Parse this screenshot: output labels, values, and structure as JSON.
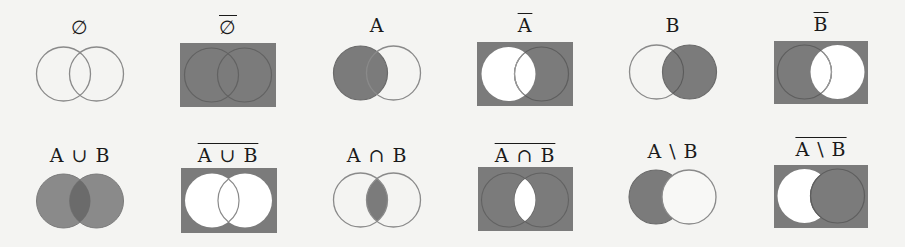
{
  "colors": {
    "background": "#f4f4f2",
    "fill": "#7b7b7b",
    "fill_light": "#8a8a8a",
    "fill_overlap": "#6b6b6b",
    "stroke": "#7a7a7a",
    "stroke_on_dark": "#5e5e5e",
    "white": "#ffffff",
    "label": "#1a1a1a"
  },
  "rows": [
    {
      "panels": [
        {
          "id": "empty",
          "label": "∅",
          "overline": false,
          "description": "Empty set: no region shaded"
        },
        {
          "id": "empty-complement",
          "label": "∅",
          "overline": true,
          "description": "Complement of empty set: entire universe shaded"
        },
        {
          "id": "a",
          "label": "A",
          "overline": false,
          "description": "Set A shaded"
        },
        {
          "id": "a-complement",
          "label": "A",
          "overline": true,
          "description": "Complement of A: everything outside A shaded"
        },
        {
          "id": "b",
          "label": "B",
          "overline": false,
          "description": "Set B shaded"
        },
        {
          "id": "b-complement",
          "label": "B",
          "overline": true,
          "description": "Complement of B: everything outside B shaded"
        }
      ]
    },
    {
      "panels": [
        {
          "id": "union",
          "label": "A ∪ B",
          "overline": false,
          "description": "Union: both circles shaded"
        },
        {
          "id": "union-complement",
          "label": "A ∪ B",
          "overline": true,
          "description": "Complement of union: outside both circles shaded"
        },
        {
          "id": "intersection",
          "label": "A ∩ B",
          "overline": false,
          "description": "Intersection: lens shaded"
        },
        {
          "id": "intersection-complement",
          "label": "A ∩ B",
          "overline": true,
          "description": "Complement of intersection: all but lens shaded"
        },
        {
          "id": "difference",
          "label": "A \\ B",
          "overline": false,
          "description": "Difference: A minus B shaded"
        },
        {
          "id": "difference-complement",
          "label": "A \\ B",
          "overline": true,
          "description": "Complement of difference: all but A\\B shaded"
        }
      ]
    }
  ]
}
